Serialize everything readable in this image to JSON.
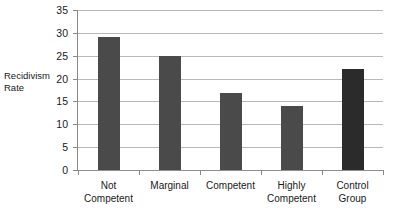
{
  "chart_data": {
    "type": "bar",
    "title": "",
    "subtitle": "",
    "xlabel": "",
    "ylabel": "Recidivism\nRate",
    "categories": [
      "Not\nCompetent",
      "Marginal",
      "Competent",
      "Highly\nCompetent",
      "Control\nGroup"
    ],
    "values": [
      29,
      25,
      16.8,
      14,
      22
    ],
    "series": [
      {
        "name": "Recidivism Rate",
        "values": [
          29,
          25,
          16.8,
          14,
          22
        ]
      }
    ],
    "ylim": [
      0,
      35
    ],
    "ytick_labels": [
      "0",
      "5",
      "10",
      "15",
      "20",
      "25",
      "30",
      "35"
    ],
    "ytick_values": [
      0,
      5,
      10,
      15,
      20,
      25,
      30,
      35
    ],
    "grid": "horizontal",
    "legend": "none",
    "bar_colors": [
      "#4a4a4a",
      "#4a4a4a",
      "#4a4a4a",
      "#4a4a4a",
      "#2b2b2b"
    ],
    "colors": {
      "default_bar": "#4a4a4a",
      "highlight_bar": "#2b2b2b",
      "gridline": "#b9b9b9",
      "axis": "#8a8a8a",
      "background": "#ffffff",
      "text": "#1a1a1a"
    }
  }
}
